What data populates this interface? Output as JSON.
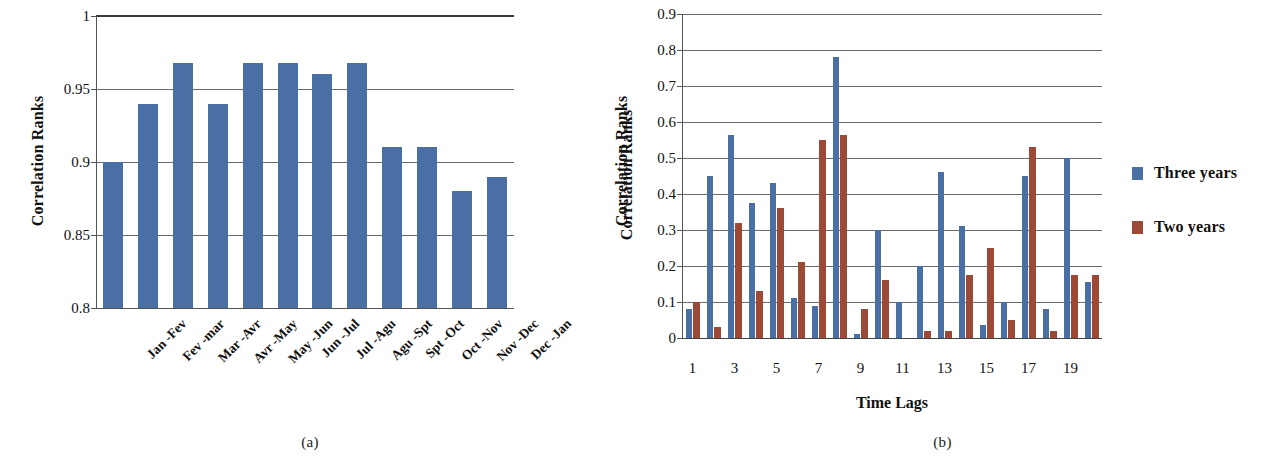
{
  "figure": {
    "panel_a_caption": "(a)",
    "panel_b_caption": "(b)"
  },
  "chart_data": [
    {
      "type": "bar",
      "panel": "(a)",
      "title": "",
      "xlabel": "",
      "ylabel": "Correlation Ranks",
      "ylabel_right": "Correlation Ranks",
      "ylim": [
        0.8,
        1.0
      ],
      "yticks": [
        "0.8",
        "0.85",
        "0.9",
        "0.95",
        "1"
      ],
      "ytick_values": [
        0.8,
        0.85,
        0.9,
        0.95,
        1.0
      ],
      "grid": true,
      "legend": null,
      "series_color": "#4a6fa5",
      "categories": [
        "Jan -Fev",
        "Fev -mar",
        "Mar -Avr",
        "Avr -May",
        "May -Jun",
        "Jun -Jul",
        "Jul -Agu",
        "Agu -Spt",
        "Spt -Oct",
        "Oct -Nov",
        "Nov -Dec",
        "Dec -Jan"
      ],
      "values": [
        0.9,
        0.94,
        0.968,
        0.94,
        0.968,
        0.968,
        0.96,
        0.968,
        0.91,
        0.91,
        0.88,
        0.89
      ]
    },
    {
      "type": "bar",
      "panel": "(b)",
      "title": "",
      "xlabel": "Time Lags",
      "ylabel": "Correlation Ranks",
      "ylim": [
        0,
        0.9
      ],
      "yticks": [
        "0",
        "0.1",
        "0.2",
        "0.3",
        "0.4",
        "0.5",
        "0.6",
        "0.7",
        "0.8",
        "0.9"
      ],
      "ytick_values": [
        0,
        0.1,
        0.2,
        0.3,
        0.4,
        0.5,
        0.6,
        0.7,
        0.8,
        0.9
      ],
      "grid": true,
      "legend_position": "right",
      "x": [
        1,
        2,
        3,
        4,
        5,
        6,
        7,
        8,
        9,
        10,
        11,
        12,
        13,
        14,
        15,
        16,
        17,
        18,
        19,
        20
      ],
      "xtick_labels": [
        "1",
        "3",
        "5",
        "7",
        "9",
        "11",
        "13",
        "15",
        "17",
        "19"
      ],
      "xtick_positions": [
        1,
        3,
        5,
        7,
        9,
        11,
        13,
        15,
        17,
        19
      ],
      "series": [
        {
          "name": "Three years",
          "color": "#4a6fa5",
          "values": [
            0.08,
            0.45,
            0.565,
            0.375,
            0.43,
            0.11,
            0.09,
            0.78,
            0.01,
            0.3,
            0.1,
            0.2,
            0.46,
            0.31,
            0.035,
            0.1,
            0.45,
            0.08,
            0.5,
            0.155
          ]
        },
        {
          "name": "Two years",
          "color": "#9c4a35",
          "values": [
            0.1,
            0.03,
            0.32,
            0.13,
            0.36,
            0.21,
            0.55,
            0.565,
            0.08,
            0.16,
            0.0,
            0.02,
            0.02,
            0.175,
            0.25,
            0.05,
            0.53,
            0.02,
            0.175,
            0.175
          ]
        }
      ]
    }
  ]
}
